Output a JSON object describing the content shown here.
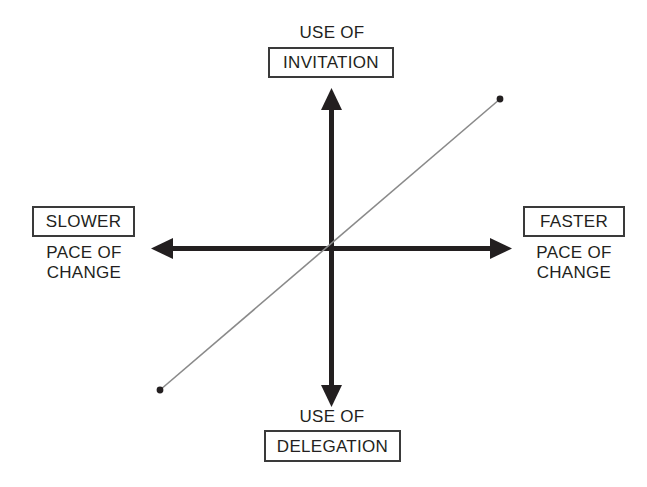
{
  "diagram": {
    "colors": {
      "axis": "#231f20",
      "trend_line": "#8a8a8a",
      "box_border": "#3a3a3a",
      "text": "#231f20",
      "background": "#ffffff"
    },
    "axes": {
      "vertical": {
        "top_label_line1": "USE OF",
        "top_label_line2": "INVITATION",
        "bottom_label_line1": "USE OF",
        "bottom_label_line2": "DELEGATION"
      },
      "horizontal": {
        "left_label_line1": "SLOWER",
        "left_label_line2": "PACE OF\nCHANGE",
        "right_label_line1": "FASTER",
        "right_label_line2": "PACE OF\nCHANGE"
      }
    },
    "trend": {
      "description": "Positively-sloped straight line from lower-left to upper-right with endpoint dots",
      "start_point": [
        160,
        390
      ],
      "end_point": [
        500,
        99
      ]
    }
  }
}
